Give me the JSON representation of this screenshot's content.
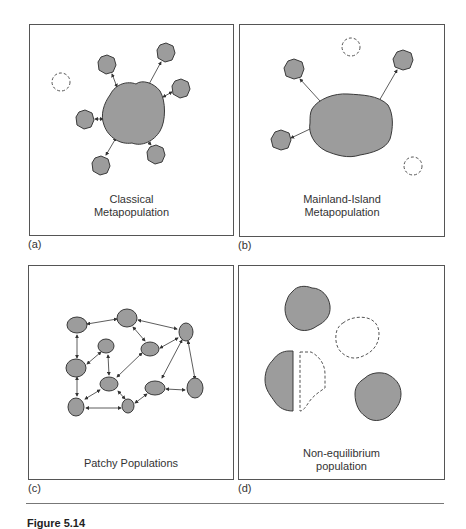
{
  "figure": {
    "caption_partial": "Figure 5.14",
    "fill_color": "#9c9c9c",
    "stroke_color": "#3a3a3a",
    "panels": [
      {
        "letter": "(a)",
        "title_line1": "Classical",
        "title_line2": "Metapopulation"
      },
      {
        "letter": "(b)",
        "title_line1": "Mainland-Island",
        "title_line2": "Metapopulation"
      },
      {
        "letter": "(c)",
        "title_line1": "Patchy Populations",
        "title_line2": ""
      },
      {
        "letter": "(d)",
        "title_line1": "Non-equilibrium",
        "title_line2": "population"
      }
    ]
  },
  "diagram": {
    "panel_a": {
      "mainland": {
        "cx": 103,
        "cy": 88,
        "r": 30
      },
      "patches": [
        {
          "cx": 77,
          "cy": 39
        },
        {
          "cx": 136,
          "cy": 27
        },
        {
          "cx": 151,
          "cy": 63
        },
        {
          "cx": 55,
          "cy": 94
        },
        {
          "cx": 71,
          "cy": 140
        },
        {
          "cx": 126,
          "cy": 129
        }
      ],
      "empty_patches": [
        {
          "cx": 31,
          "cy": 57
        }
      ]
    },
    "panel_b": {
      "mainland": {
        "cx": 108,
        "cy": 99
      },
      "patches": [
        {
          "cx": 54,
          "cy": 44
        },
        {
          "cx": 163,
          "cy": 35
        },
        {
          "cx": 41,
          "cy": 115
        }
      ],
      "empty_patches": [
        {
          "cx": 111,
          "cy": 22
        },
        {
          "cx": 173,
          "cy": 141
        }
      ]
    },
    "panel_c": {
      "nodes": [
        "A",
        "B",
        "C",
        "D",
        "E",
        "F",
        "G",
        "H",
        "I",
        "J",
        "K"
      ],
      "links": [
        [
          "A",
          "B"
        ],
        [
          "B",
          "C"
        ],
        [
          "B",
          "E"
        ],
        [
          "E",
          "C"
        ],
        [
          "A",
          "F"
        ],
        [
          "D",
          "F"
        ],
        [
          "D",
          "G"
        ],
        [
          "F",
          "J"
        ],
        [
          "G",
          "J"
        ],
        [
          "G",
          "E"
        ],
        [
          "G",
          "K"
        ],
        [
          "J",
          "K"
        ],
        [
          "K",
          "H"
        ],
        [
          "H",
          "I"
        ],
        [
          "C",
          "H"
        ],
        [
          "C",
          "I"
        ]
      ]
    },
    "panel_d": {
      "occupied": 3,
      "empty": 1,
      "partial": 1
    }
  }
}
